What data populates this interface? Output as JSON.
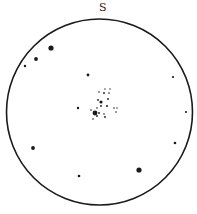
{
  "diagram": {
    "type": "star-chart",
    "direction_label": "S",
    "circle": {
      "cx": 99.5,
      "cy": 112,
      "r": 93,
      "stroke": "#1a1a1a",
      "stroke_width": 1.6
    },
    "stars": [
      {
        "x": 51,
        "y": 48,
        "r": 2.6
      },
      {
        "x": 36,
        "y": 59,
        "r": 1.9
      },
      {
        "x": 25,
        "y": 66,
        "r": 1.2
      },
      {
        "x": 88,
        "y": 75,
        "r": 1.4
      },
      {
        "x": 173,
        "y": 77,
        "r": 1.1
      },
      {
        "x": 78,
        "y": 108,
        "r": 1.2
      },
      {
        "x": 186,
        "y": 112,
        "r": 1.0
      },
      {
        "x": 33,
        "y": 148,
        "r": 1.9
      },
      {
        "x": 175,
        "y": 143,
        "r": 1.3
      },
      {
        "x": 79,
        "y": 176,
        "r": 1.3
      },
      {
        "x": 139,
        "y": 170,
        "r": 2.6
      },
      {
        "x": 95,
        "y": 113,
        "r": 2.4
      },
      {
        "x": 101,
        "y": 102,
        "r": 1.6
      },
      {
        "x": 99,
        "y": 92,
        "r": 0.8
      },
      {
        "x": 105,
        "y": 89,
        "r": 0.7
      },
      {
        "x": 110,
        "y": 89,
        "r": 0.7
      },
      {
        "x": 104,
        "y": 93,
        "r": 0.9
      },
      {
        "x": 109,
        "y": 93,
        "r": 0.8
      },
      {
        "x": 98,
        "y": 100,
        "r": 0.9
      },
      {
        "x": 108,
        "y": 99,
        "r": 0.9
      },
      {
        "x": 101,
        "y": 106,
        "r": 0.9
      },
      {
        "x": 97,
        "y": 108,
        "r": 0.8
      },
      {
        "x": 107,
        "y": 106,
        "r": 1.0
      },
      {
        "x": 91,
        "y": 110,
        "r": 0.8
      },
      {
        "x": 99,
        "y": 113,
        "r": 0.9
      },
      {
        "x": 104,
        "y": 114,
        "r": 0.8
      },
      {
        "x": 97,
        "y": 116,
        "r": 0.9
      },
      {
        "x": 105,
        "y": 117,
        "r": 0.9
      },
      {
        "x": 93,
        "y": 119,
        "r": 0.8
      },
      {
        "x": 114,
        "y": 108,
        "r": 0.8
      },
      {
        "x": 117,
        "y": 108,
        "r": 0.7
      },
      {
        "x": 116,
        "y": 112,
        "r": 0.8
      }
    ]
  }
}
